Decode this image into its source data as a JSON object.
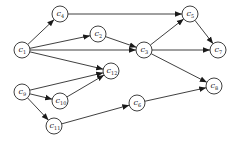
{
  "diagram": {
    "type": "directed-graph",
    "node_radius": 8,
    "colors": {
      "stroke": "#2a2a2a",
      "fill": "#ffffff",
      "text": "#1a1a1a",
      "background": "#ffffff"
    },
    "nodes": [
      {
        "id": "c1",
        "base": "c",
        "sub": "1",
        "x": 22,
        "y": 50
      },
      {
        "id": "c2",
        "base": "c",
        "sub": "2",
        "x": 98,
        "y": 34
      },
      {
        "id": "c3",
        "base": "c",
        "sub": "3",
        "x": 144,
        "y": 50
      },
      {
        "id": "c4",
        "base": "c",
        "sub": "4",
        "x": 60,
        "y": 14
      },
      {
        "id": "c5",
        "base": "c",
        "sub": "5",
        "x": 190,
        "y": 14
      },
      {
        "id": "c6",
        "base": "c",
        "sub": "6",
        "x": 137,
        "y": 103
      },
      {
        "id": "c7",
        "base": "c",
        "sub": "7",
        "x": 218,
        "y": 50
      },
      {
        "id": "c8",
        "base": "c",
        "sub": "8",
        "x": 214,
        "y": 86
      },
      {
        "id": "c9",
        "base": "c",
        "sub": "9",
        "x": 22,
        "y": 92
      },
      {
        "id": "c10",
        "base": "c",
        "sub": "10",
        "x": 60,
        "y": 101
      },
      {
        "id": "c11",
        "base": "c",
        "sub": "11",
        "x": 54,
        "y": 126
      },
      {
        "id": "c12",
        "base": "c",
        "sub": "12",
        "x": 111,
        "y": 71
      }
    ],
    "edges": [
      {
        "from": "c1",
        "to": "c4"
      },
      {
        "from": "c1",
        "to": "c2"
      },
      {
        "from": "c1",
        "to": "c3"
      },
      {
        "from": "c1",
        "to": "c12"
      },
      {
        "from": "c4",
        "to": "c5"
      },
      {
        "from": "c2",
        "to": "c3"
      },
      {
        "from": "c3",
        "to": "c5"
      },
      {
        "from": "c3",
        "to": "c7"
      },
      {
        "from": "c5",
        "to": "c7"
      },
      {
        "from": "c3",
        "to": "c8"
      },
      {
        "from": "c9",
        "to": "c12"
      },
      {
        "from": "c9",
        "to": "c10"
      },
      {
        "from": "c9",
        "to": "c11"
      },
      {
        "from": "c10",
        "to": "c12"
      },
      {
        "from": "c11",
        "to": "c6"
      },
      {
        "from": "c6",
        "to": "c8"
      }
    ]
  }
}
